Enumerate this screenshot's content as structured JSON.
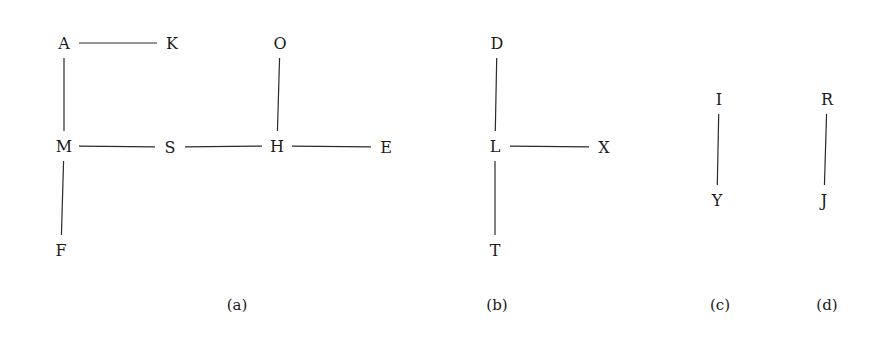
{
  "colors": {
    "ink": "#1a1a1a",
    "edge": "#2a2a2a",
    "background": "#ffffff"
  },
  "graphs": [
    {
      "id": "a",
      "caption": "(a)",
      "caption_pos": [
        237,
        305
      ],
      "nodes": [
        {
          "id": "A",
          "label": "A",
          "x": 64,
          "y": 43
        },
        {
          "id": "K",
          "label": "K",
          "x": 172,
          "y": 43
        },
        {
          "id": "O",
          "label": "O",
          "x": 280,
          "y": 43
        },
        {
          "id": "M",
          "label": "M",
          "x": 64,
          "y": 146
        },
        {
          "id": "S",
          "label": "S",
          "x": 170,
          "y": 147
        },
        {
          "id": "H",
          "label": "H",
          "x": 277,
          "y": 146
        },
        {
          "id": "E",
          "label": "E",
          "x": 386,
          "y": 147
        },
        {
          "id": "F",
          "label": "F",
          "x": 61,
          "y": 250
        }
      ],
      "edges": [
        [
          "A",
          "K"
        ],
        [
          "A",
          "M"
        ],
        [
          "M",
          "S"
        ],
        [
          "S",
          "H"
        ],
        [
          "H",
          "E"
        ],
        [
          "H",
          "O"
        ],
        [
          "M",
          "F"
        ]
      ]
    },
    {
      "id": "b",
      "caption": "(b)",
      "caption_pos": [
        497,
        305
      ],
      "nodes": [
        {
          "id": "D",
          "label": "D",
          "x": 497,
          "y": 43
        },
        {
          "id": "L",
          "label": "L",
          "x": 495,
          "y": 146
        },
        {
          "id": "X",
          "label": "X",
          "x": 604,
          "y": 147
        },
        {
          "id": "T",
          "label": "T",
          "x": 495,
          "y": 250
        }
      ],
      "edges": [
        [
          "D",
          "L"
        ],
        [
          "L",
          "X"
        ],
        [
          "L",
          "T"
        ]
      ]
    },
    {
      "id": "c",
      "caption": "(c)",
      "caption_pos": [
        720,
        305
      ],
      "nodes": [
        {
          "id": "I",
          "label": "I",
          "x": 719,
          "y": 99
        },
        {
          "id": "Y",
          "label": "Y",
          "x": 717,
          "y": 200
        }
      ],
      "edges": [
        [
          "I",
          "Y"
        ]
      ]
    },
    {
      "id": "d",
      "caption": "(d)",
      "caption_pos": [
        827,
        305
      ],
      "nodes": [
        {
          "id": "R",
          "label": "R",
          "x": 827,
          "y": 99
        },
        {
          "id": "J",
          "label": "J",
          "x": 824,
          "y": 200
        }
      ],
      "edges": [
        [
          "R",
          "J"
        ]
      ]
    }
  ]
}
